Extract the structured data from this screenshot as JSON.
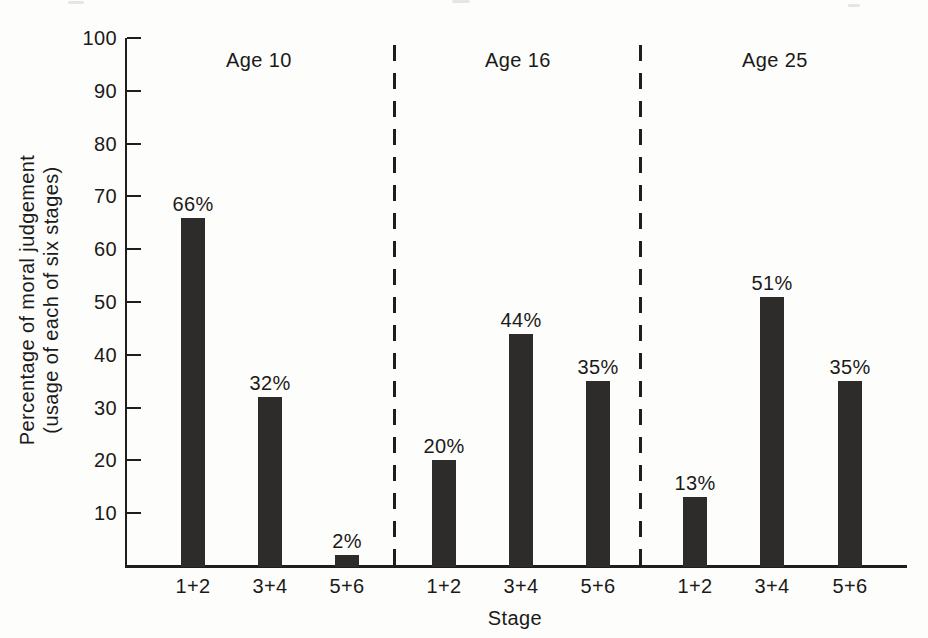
{
  "chart_data": {
    "type": "bar",
    "title": "",
    "xlabel": "Stage",
    "ylabel": "Percentage of moral judgement (usage of each of six stages)",
    "ylabel_lines": [
      "Percentage of moral judgement",
      "(usage of each of six stages)"
    ],
    "ylim": [
      0,
      100
    ],
    "yticks": [
      100,
      90,
      80,
      70,
      60,
      50,
      40,
      30,
      20,
      10
    ],
    "grid": "off",
    "legend": "none",
    "categories": [
      "1+2",
      "3+4",
      "5+6"
    ],
    "groups": [
      {
        "label": "Age 10",
        "values": [
          66,
          32,
          2
        ],
        "value_labels": [
          "66%",
          "32%",
          "2%"
        ]
      },
      {
        "label": "Age 16",
        "values": [
          20,
          44,
          35
        ],
        "value_labels": [
          "20%",
          "44%",
          "35%"
        ]
      },
      {
        "label": "Age 25",
        "values": [
          13,
          51,
          35
        ],
        "value_labels": [
          "13%",
          "51%",
          "35%"
        ]
      }
    ],
    "separators": {
      "style": "dashed",
      "between_groups": true
    },
    "colors": {
      "bar": "#2d2c2a",
      "axis": "#1f1e1c",
      "text": "#1b1a18",
      "background": "#fdfdfc"
    }
  }
}
